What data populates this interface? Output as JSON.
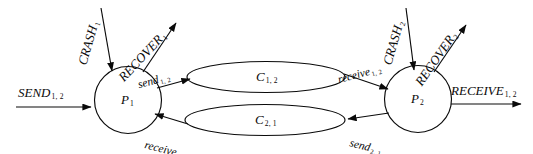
{
  "diagram": {
    "type": "state-communication-diagram",
    "background_color": "#ffffff",
    "stroke_color": "#0a0a0a",
    "nodes": [
      {
        "id": "p1",
        "label": "P",
        "subscript": "1",
        "shape": "circle"
      },
      {
        "id": "p2",
        "label": "P",
        "subscript": "2",
        "shape": "circle"
      }
    ],
    "channels": [
      {
        "id": "c12",
        "label": "C",
        "subscript": "1, 2",
        "shape": "ellipse"
      },
      {
        "id": "c21",
        "label": "C",
        "subscript": "2, 1",
        "shape": "ellipse"
      }
    ],
    "edges": [
      {
        "id": "send-in",
        "label": "SEND",
        "subscript": "1, 2",
        "style": "uppercase-italic",
        "direction": "into-p1"
      },
      {
        "id": "crash1",
        "label": "CRASH",
        "subscript": "1",
        "style": "uppercase-italic",
        "direction": "into-p1"
      },
      {
        "id": "recover1",
        "label": "RECOVER",
        "subscript": "1",
        "style": "uppercase-italic",
        "direction": "out-of-p1"
      },
      {
        "id": "send12",
        "label": "send",
        "subscript": "1, 2",
        "style": "lowercase-italic",
        "direction": "p1-to-c12"
      },
      {
        "id": "receive12",
        "label": "receive",
        "subscript": "1, 2",
        "style": "lowercase-italic",
        "direction": "c12-to-p2"
      },
      {
        "id": "send21",
        "label": "send",
        "subscript": "2, 1",
        "style": "lowercase-italic",
        "direction": "p2-to-c21"
      },
      {
        "id": "receive21",
        "label": "receive",
        "subscript": "2, 1",
        "style": "lowercase-italic",
        "direction": "c21-to-p1"
      },
      {
        "id": "crash2",
        "label": "CRASH",
        "subscript": "2",
        "style": "uppercase-italic",
        "direction": "into-p2"
      },
      {
        "id": "recover2",
        "label": "RECOVER",
        "subscript": "2",
        "style": "uppercase-italic",
        "direction": "out-of-p2"
      },
      {
        "id": "receive-out",
        "label": "RECEIVE",
        "subscript": "1, 2",
        "style": "uppercase-italic",
        "direction": "out-of-p2"
      }
    ]
  }
}
